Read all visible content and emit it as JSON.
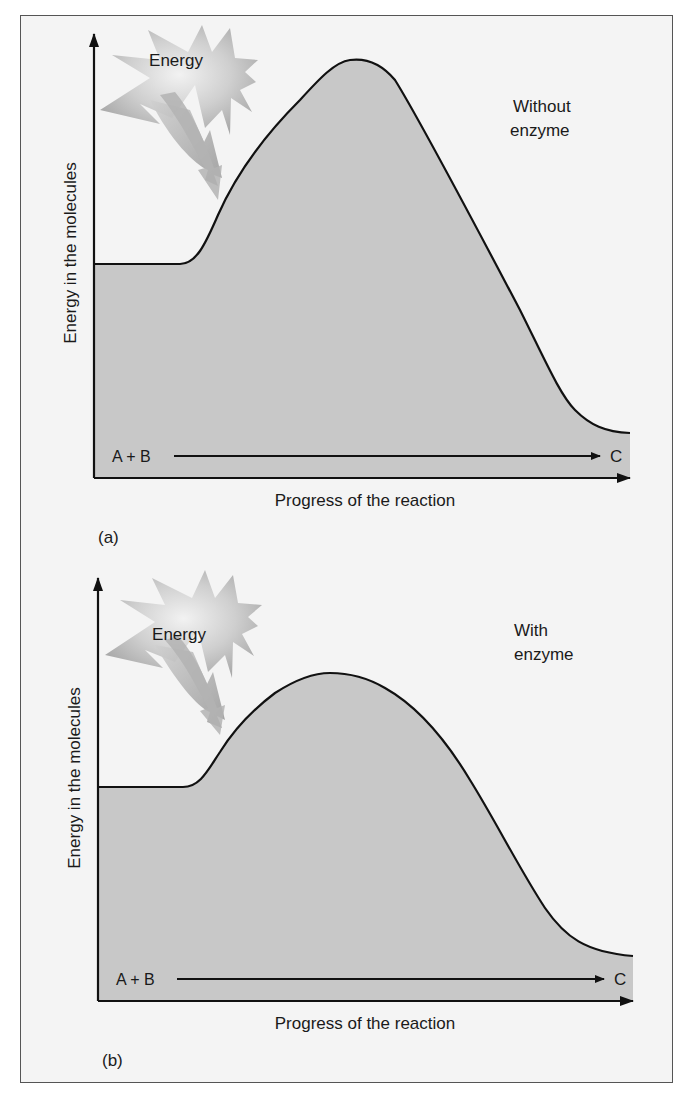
{
  "figure": {
    "panels": [
      {
        "id": "a",
        "panel_label": "(a)",
        "condition_label": [
          "Without",
          "enzyme"
        ],
        "energy_burst_label": "Energy",
        "y_axis_label": "Energy in the molecules",
        "x_axis_label": "Progress of the reaction",
        "reactants_label": "A + B",
        "product_label": "C"
      },
      {
        "id": "b",
        "panel_label": "(b)",
        "condition_label": [
          "With",
          "enzyme"
        ],
        "energy_burst_label": "Energy",
        "y_axis_label": "Energy in the molecules",
        "x_axis_label": "Progress of the reaction",
        "reactants_label": "A + B",
        "product_label": "C"
      }
    ],
    "colors": {
      "background": "#f4f4f4",
      "curve_fill": "#c8c8c8",
      "curve_stroke": "#111111",
      "burst_fill": "#bdbdbd",
      "text": "#1a1a1a"
    }
  }
}
